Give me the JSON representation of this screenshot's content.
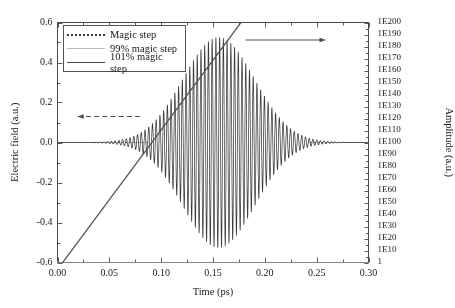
{
  "chart_data": {
    "type": "line",
    "title": "",
    "xlabel": "Time (ps)",
    "ylabel": "Electric field (a.u.)",
    "y2label": "Amplitude (a.u.)",
    "xlim": [
      0.0,
      0.3
    ],
    "ylim": [
      -0.6,
      0.6
    ],
    "y2lim_exp": [
      0,
      200
    ],
    "xticks": [
      "0.00",
      "0.05",
      "0.10",
      "0.15",
      "0.20",
      "0.25",
      "0.30"
    ],
    "xtick_values": [
      0.0,
      0.05,
      0.1,
      0.15,
      0.2,
      0.25,
      0.3
    ],
    "yticks": [
      "0.6",
      "0.4",
      "0.2",
      "0.0",
      "-0.2",
      "-0.4",
      "-0.6"
    ],
    "ytick_values": [
      0.6,
      0.4,
      0.2,
      0.0,
      -0.2,
      -0.4,
      -0.6
    ],
    "y2ticks": [
      "1E200",
      "1E190",
      "1E180",
      "1E170",
      "1E160",
      "1E150",
      "1E140",
      "1E130",
      "1E120",
      "1E110",
      "1E100",
      "1E90",
      "1E80",
      "1E70",
      "1E60",
      "1E50",
      "1E40",
      "1E30",
      "1E20",
      "1E10",
      "1"
    ],
    "y2tick_exponents": [
      200,
      190,
      180,
      170,
      160,
      150,
      140,
      130,
      120,
      110,
      100,
      90,
      80,
      70,
      60,
      50,
      40,
      30,
      20,
      10,
      0
    ],
    "grid": false,
    "legend_position": "upper-left",
    "series": [
      {
        "name": "Magic step",
        "style": "dotted",
        "color": "#3a3a3a",
        "axis": "left",
        "model": "gaussian-carrier",
        "carrier_period_ps": 0.0036,
        "envelope_center_ps": 0.1555,
        "envelope_sigma_ps": 0.0345,
        "peak_amplitude": 0.525,
        "baseline": 0.0
      },
      {
        "name": "99% magic step",
        "style": "solid",
        "color": "#c6c6c6",
        "axis": "right",
        "model": "flat-decay",
        "value_exponent": 0
      },
      {
        "name": "101% magic step",
        "style": "solid",
        "color": "#4f4f4f",
        "axis": "right",
        "model": "exponential-growth",
        "start_ps": 0.005,
        "start_exponent": 0,
        "end_ps": 0.177,
        "end_exponent": 200
      }
    ],
    "annotations": [
      {
        "name": "left-axis-arrow",
        "type": "arrow",
        "direction": "left",
        "style": "dashed",
        "x_start_ps": 0.0195,
        "x_end_ps": 0.0795,
        "y_value": 0.13,
        "color": "#4a4a4a"
      },
      {
        "name": "right-axis-arrow",
        "type": "arrow",
        "direction": "right",
        "style": "solid",
        "x_start_ps": 0.1815,
        "x_end_ps": 0.2585,
        "y_value": 0.5125,
        "color": "#4a4a4a"
      }
    ]
  },
  "legend": {
    "items": [
      {
        "label": "Magic step"
      },
      {
        "label": "99% magic step"
      },
      {
        "label": "101% magic step"
      }
    ]
  },
  "axes": {
    "x_title": "Time (ps)",
    "y_title": "Electric field (a.u.)",
    "y2_title": "Amplitude (a.u.)"
  },
  "colors": {
    "frame": "#4a4a4a",
    "magic_step": "#3a3a3a",
    "ninety_nine": "#c6c6c6",
    "one_o_one": "#4f4f4f",
    "background": "#ffffff"
  }
}
